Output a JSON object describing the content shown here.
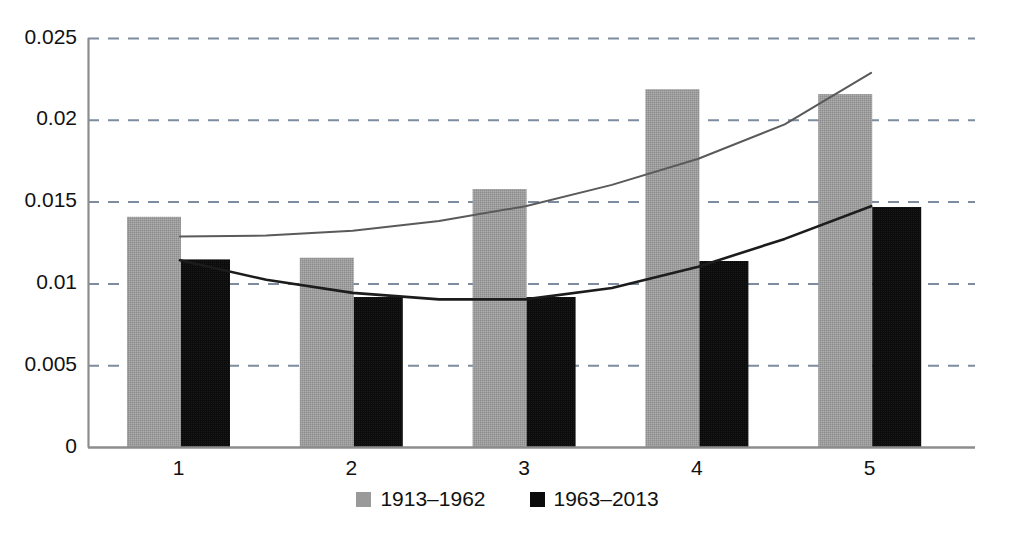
{
  "chart_data": {
    "type": "bar",
    "title": "",
    "subtitle": "",
    "xlabel": "",
    "ylabel": "",
    "categories": [
      "1",
      "2",
      "3",
      "4",
      "5"
    ],
    "ylim": [
      0,
      0.025
    ],
    "yticks": [
      0,
      0.005,
      0.01,
      0.015,
      0.02,
      0.025
    ],
    "ytick_labels": [
      "0",
      "0.005",
      "0.01",
      "0.015",
      "0.02",
      "0.025"
    ],
    "grid": true,
    "grid_style": "dashed-horizontal",
    "legend_position": "bottom-center",
    "series": [
      {
        "name": "1913–1962",
        "color": "#9a9a9a",
        "values": [
          0.0141,
          0.0116,
          0.0158,
          0.0219,
          0.0216
        ]
      },
      {
        "name": "1963–2013",
        "color": "#0b0b0b",
        "values": [
          0.0115,
          0.0092,
          0.0092,
          0.0114,
          0.0147
        ]
      }
    ],
    "trendlines": [
      {
        "name": "1913–1962 trend",
        "color": "#5a5a5a",
        "fit": "quadratic",
        "x": [
          1,
          1.5,
          2,
          2.5,
          3,
          3.5,
          4,
          4.5,
          5
        ],
        "y": [
          0.0129,
          0.01295,
          0.01325,
          0.01385,
          0.01475,
          0.01605,
          0.01765,
          0.01975,
          0.0229
        ]
      },
      {
        "name": "1963–2013 trend",
        "color": "#1c1c1c",
        "fit": "quadratic",
        "x": [
          1,
          1.5,
          2,
          2.5,
          3,
          3.5,
          4,
          4.5,
          5
        ],
        "y": [
          0.01145,
          0.01025,
          0.00945,
          0.00905,
          0.00905,
          0.00975,
          0.01105,
          0.01275,
          0.01475
        ]
      }
    ]
  },
  "axes": {
    "ytick_labels": [
      "0.025",
      "0.02",
      "0.015",
      "0.01",
      "0.005",
      "0"
    ],
    "xtick_labels": [
      "1",
      "2",
      "3",
      "4",
      "5"
    ]
  },
  "legend": {
    "items": [
      {
        "label": "1913–1962",
        "swatch": "gray-square-icon"
      },
      {
        "label": "1963–2013",
        "swatch": "black-square-icon"
      }
    ]
  },
  "colors": {
    "series_a": "#9a9a9a",
    "series_b": "#0b0b0b",
    "axis": "#8a8a8a",
    "grid": "#6f7f95",
    "trend_a": "#5a5a5a",
    "trend_b": "#1c1c1c",
    "text": "#111111"
  }
}
